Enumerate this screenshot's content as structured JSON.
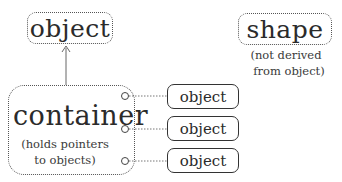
{
  "diagram": {
    "base_object": {
      "label": "object"
    },
    "shape": {
      "label": "shape",
      "note_line1": "(not derived",
      "note_line2": "from object)"
    },
    "container": {
      "label": "container",
      "note_line1": "(holds pointers",
      "note_line2": "to objects)"
    },
    "contained_objects": [
      {
        "label": "object"
      },
      {
        "label": "object"
      },
      {
        "label": "object"
      }
    ],
    "colors": {
      "stroke": "#555555",
      "text": "#2b2b2b",
      "background": "#ffffff"
    }
  }
}
